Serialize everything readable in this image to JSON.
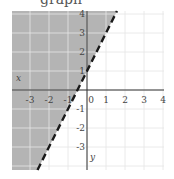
{
  "header": {
    "title_fragment": "graph"
  },
  "chart_data": {
    "type": "line",
    "title": "",
    "boundary_line": {
      "equation": "y = 2x + 1",
      "slope": 2,
      "intercept": 1,
      "style": "dashed"
    },
    "inequality": "y > 2x + 1",
    "shaded_side": "left",
    "xlabel": "x",
    "ylabel": "y",
    "xlim": [
      -3.5,
      4.25
    ],
    "ylim": [
      -3.5,
      4.25
    ],
    "x_ticks": [
      "-3",
      "-2",
      "-1",
      "0",
      "1",
      "2",
      "3",
      "4"
    ],
    "y_ticks": [
      "4",
      "3",
      "2",
      "1",
      "-1",
      "-2",
      "-3"
    ],
    "grid": true,
    "colors": {
      "shade": "#b4b4b4",
      "line": "#1a1a1a",
      "grid": "#e6e6e6",
      "axis": "#333333"
    }
  }
}
